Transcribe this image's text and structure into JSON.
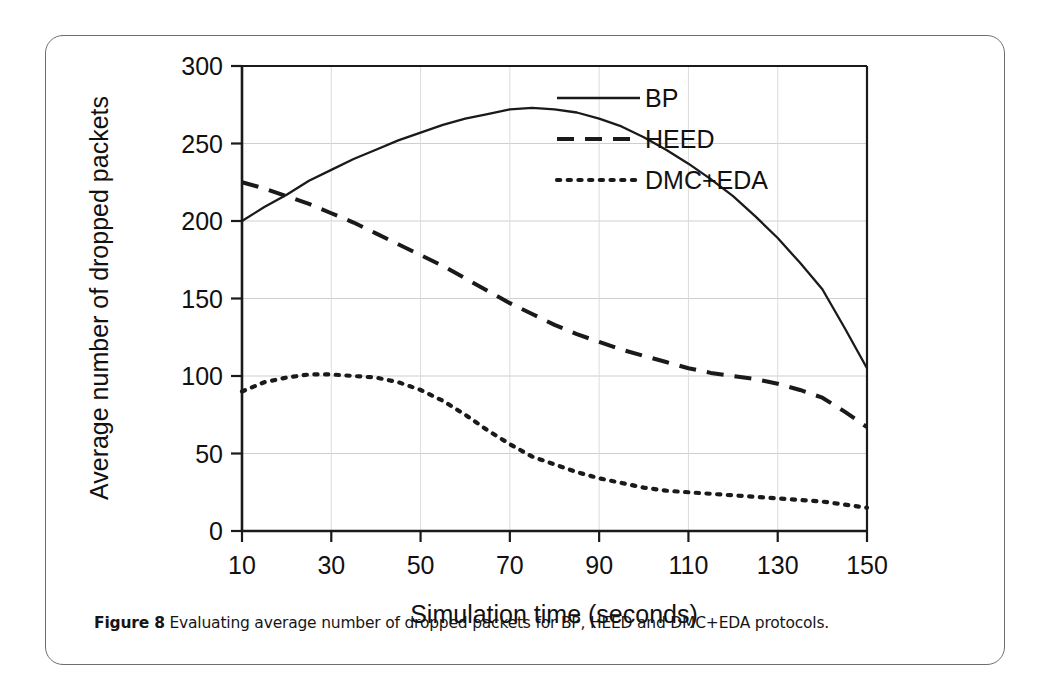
{
  "figure": {
    "caption_label": "Figure 8",
    "caption_text": " Evaluating average number of dropped packets for BP, HEED and DMC+EDA protocols."
  },
  "chart_data": {
    "type": "line",
    "title": "",
    "xlabel": "Simulation time (seconds)",
    "ylabel": "Average number of dropped packets",
    "xlim": [
      10,
      150
    ],
    "ylim": [
      0,
      300
    ],
    "xticks": [
      10,
      30,
      50,
      70,
      90,
      110,
      130,
      150
    ],
    "xtick_labels": [
      "10",
      "30",
      "50",
      "70",
      "90",
      "110",
      "130",
      "150"
    ],
    "yticks": [
      0,
      50,
      100,
      150,
      200,
      250,
      300
    ],
    "ytick_labels": [
      "0",
      "50",
      "100",
      "150",
      "200",
      "250",
      "300"
    ],
    "grid": true,
    "legend_position": "top-right",
    "x": [
      10,
      15,
      20,
      25,
      30,
      35,
      40,
      45,
      50,
      55,
      60,
      65,
      70,
      75,
      80,
      85,
      90,
      95,
      100,
      105,
      110,
      115,
      120,
      125,
      130,
      135,
      140,
      145,
      150
    ],
    "series": [
      {
        "name": "BP",
        "style": "solid",
        "color": "#1a1a1a",
        "values": [
          200,
          209,
          217,
          226,
          233,
          240,
          246,
          252,
          257,
          262,
          266,
          269,
          272,
          273,
          272,
          270,
          266,
          261,
          254,
          246,
          237,
          227,
          216,
          203,
          189,
          173,
          156,
          131,
          105
        ]
      },
      {
        "name": "HEED",
        "style": "dashed",
        "color": "#1a1a1a",
        "values": [
          225,
          221,
          216,
          211,
          205,
          199,
          192,
          185,
          178,
          171,
          163,
          155,
          147,
          140,
          133,
          127,
          122,
          117,
          113,
          109,
          105,
          102,
          100,
          98,
          95,
          91,
          86,
          77,
          67
        ]
      },
      {
        "name": "DMC+EDA",
        "style": "dotted",
        "color": "#1a1a1a",
        "values": [
          90,
          96,
          99,
          101,
          101,
          100,
          99,
          96,
          91,
          84,
          75,
          65,
          56,
          48,
          43,
          38,
          34,
          31,
          28,
          26,
          25,
          24,
          23,
          22,
          21,
          20,
          19,
          17,
          15
        ]
      }
    ]
  },
  "legend": {
    "items": [
      {
        "label": "BP",
        "style": "solid"
      },
      {
        "label": "HEED",
        "style": "dashed"
      },
      {
        "label": "DMC+EDA",
        "style": "dotted"
      }
    ]
  }
}
